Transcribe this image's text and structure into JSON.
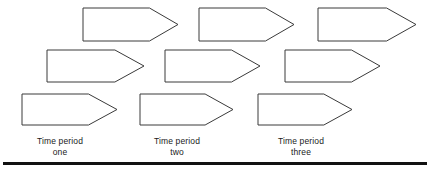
{
  "diagram": {
    "type": "staircase-arrow-chart",
    "stroke_color": "#3a3a3a",
    "fill_color": "#ffffff",
    "background_color": "#ffffff",
    "rule_color": "#111111",
    "rows": [
      {
        "row_index": 0,
        "arrows": [
          {
            "name": "arrow-r1-c1",
            "x": 83,
            "y": 8,
            "width": 95,
            "height": 33,
            "head_ratio": 0.3
          },
          {
            "name": "arrow-r1-c2",
            "x": 199,
            "y": 8,
            "width": 95,
            "height": 33,
            "head_ratio": 0.3
          },
          {
            "name": "arrow-r1-c3",
            "x": 318,
            "y": 8,
            "width": 98,
            "height": 33,
            "head_ratio": 0.3
          }
        ]
      },
      {
        "row_index": 1,
        "arrows": [
          {
            "name": "arrow-r2-c1",
            "x": 47,
            "y": 50,
            "width": 97,
            "height": 32,
            "head_ratio": 0.3
          },
          {
            "name": "arrow-r2-c2",
            "x": 165,
            "y": 50,
            "width": 95,
            "height": 32,
            "head_ratio": 0.3
          },
          {
            "name": "arrow-r2-c3",
            "x": 285,
            "y": 50,
            "width": 95,
            "height": 32,
            "head_ratio": 0.3
          }
        ]
      },
      {
        "row_index": 2,
        "arrows": [
          {
            "name": "arrow-r3-c1",
            "x": 22,
            "y": 94,
            "width": 95,
            "height": 31,
            "head_ratio": 0.3
          },
          {
            "name": "arrow-r3-c2",
            "x": 140,
            "y": 94,
            "width": 93,
            "height": 31,
            "head_ratio": 0.3
          },
          {
            "name": "arrow-r3-c3",
            "x": 258,
            "y": 94,
            "width": 94,
            "height": 31,
            "head_ratio": 0.3
          }
        ]
      }
    ],
    "labels": [
      {
        "name": "time-period-one",
        "line1": "Time period",
        "line2": "one",
        "center_x": 60,
        "top": 136
      },
      {
        "name": "time-period-two",
        "line1": "Time period",
        "line2": "two",
        "center_x": 177,
        "top": 136
      },
      {
        "name": "time-period-three",
        "line1": "Time period",
        "line2": "three",
        "center_x": 301,
        "top": 136
      }
    ],
    "baseline_rule": {
      "name": "baseline-rule",
      "x": 3,
      "y": 162,
      "width": 424,
      "height": 3
    }
  }
}
